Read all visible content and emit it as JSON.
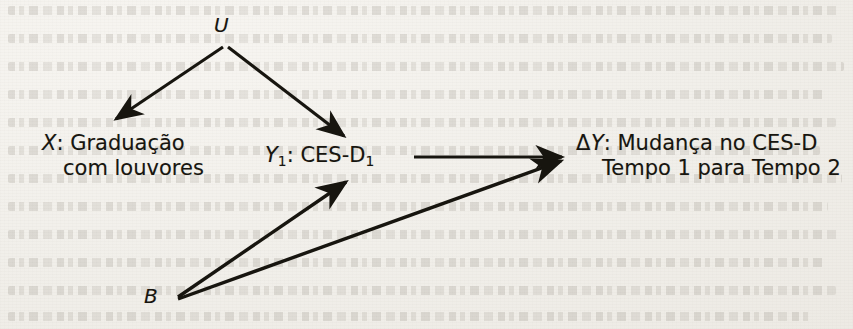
{
  "diagram": {
    "type": "causal-path-diagram",
    "language": "pt-BR",
    "nodes": [
      {
        "id": "U",
        "label": "U",
        "italic": true,
        "x": 224,
        "y": 27
      },
      {
        "id": "X",
        "label_line1": "X: Graduação",
        "label_line2": "com louvores",
        "x": 42,
        "y": 141
      },
      {
        "id": "Y1",
        "label": "Y1: CES-D1",
        "x": 265,
        "y": 157
      },
      {
        "id": "dY",
        "label_line1": "ΔY: Mudança no CES-D",
        "label_line2": "Tempo 1 para Tempo 2",
        "x": 576,
        "y": 141
      },
      {
        "id": "B",
        "label": "B",
        "italic": true,
        "x": 152,
        "y": 298
      }
    ],
    "node_text": {
      "u": "U",
      "x_var": "X",
      "x_line1_rest": ": Graduação",
      "x_line2": "com louvores",
      "y1_var": "Y",
      "y1_sub": "1",
      "y1_mid": ": CES-D",
      "y1_sub2": "1",
      "dy_delta": "Δ",
      "dy_var": "Y",
      "dy_line1_rest": ": Mudança no CES-D",
      "dy_line2": "Tempo 1 para Tempo 2",
      "b": "B"
    },
    "edges": [
      {
        "from": "U",
        "to": "X",
        "x1": 224,
        "y1": 47,
        "x2": 113,
        "y2": 122
      },
      {
        "from": "U",
        "to": "Y1",
        "x1": 228,
        "y1": 47,
        "x2": 347,
        "y2": 139
      },
      {
        "from": "Y1",
        "to": "dY",
        "x1": 414,
        "y1": 157,
        "x2": 566,
        "y2": 157
      },
      {
        "from": "B",
        "to": "Y1",
        "x1": 178,
        "y1": 297,
        "x2": 349,
        "y2": 179
      },
      {
        "from": "B",
        "to": "dY",
        "x1": 178,
        "y1": 298,
        "x2": 566,
        "y2": 160
      }
    ],
    "colors": {
      "ink": "#17150f",
      "paper": "#f3f1ed",
      "ghost": "#6c6458"
    }
  }
}
